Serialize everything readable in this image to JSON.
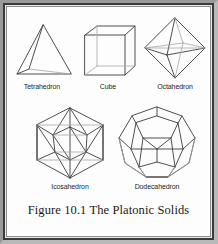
{
  "figure": {
    "caption": "Figure 10.1 The Platonic Solids",
    "background_color": "#fdfdfd",
    "edge_color": "#3b3b3b",
    "hidden_edge_color": "#a6a6a6",
    "frame_color": "#3a3a3a",
    "text_color": "#1e1e1e"
  },
  "solids": [
    {
      "label": "Tetrahedron",
      "faces": 4,
      "vertices": 4,
      "edges": 6,
      "icon": "tetrahedron-wireframe",
      "row": 1,
      "column": 1
    },
    {
      "label": "Cube",
      "faces": 6,
      "vertices": 8,
      "edges": 12,
      "icon": "cube-wireframe",
      "row": 1,
      "column": 2
    },
    {
      "label": "Octahedron",
      "faces": 8,
      "vertices": 6,
      "edges": 12,
      "icon": "octahedron-wireframe",
      "row": 1,
      "column": 3
    },
    {
      "label": "Icosahedron",
      "faces": 20,
      "vertices": 12,
      "edges": 30,
      "icon": "icosahedron-wireframe",
      "row": 2,
      "column": 1
    },
    {
      "label": "Dodecahedron",
      "faces": 12,
      "vertices": 20,
      "edges": 30,
      "icon": "dodecahedron-wireframe",
      "row": 2,
      "column": 2
    }
  ]
}
